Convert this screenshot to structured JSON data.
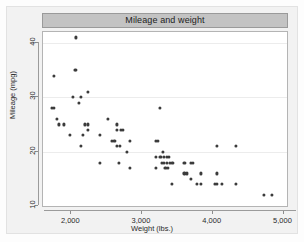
{
  "chart_data": {
    "type": "scatter",
    "title": "Mileage and weight",
    "xlabel": "Weight (lbs.)",
    "ylabel": "Mileage (mpg)",
    "xlim": [
      1600,
      5050
    ],
    "ylim": [
      10,
      42
    ],
    "xticks": [
      2000,
      3000,
      4000,
      5000
    ],
    "xticklabels": [
      "2,000",
      "3,000",
      "4,000",
      "5,000"
    ],
    "yticks": [
      10,
      20,
      30,
      40
    ],
    "yticklabels": [
      "10",
      "20",
      "30",
      "40"
    ],
    "grid": "horizontal",
    "legend": null,
    "marker_color": "#3b3b3b",
    "title_bar_color": "#c3c3c3",
    "graph_region_color": "#f2f2f2",
    "plot_region_color": "#ffffff",
    "points": [
      {
        "x": 2070,
        "y": 41
      },
      {
        "x": 1760,
        "y": 34
      },
      {
        "x": 2050,
        "y": 35
      },
      {
        "x": 2070,
        "y": 35
      },
      {
        "x": 2230,
        "y": 31
      },
      {
        "x": 2020,
        "y": 30
      },
      {
        "x": 2130,
        "y": 30
      },
      {
        "x": 2110,
        "y": 29
      },
      {
        "x": 3250,
        "y": 28
      },
      {
        "x": 1730,
        "y": 28
      },
      {
        "x": 1760,
        "y": 28
      },
      {
        "x": 1800,
        "y": 26
      },
      {
        "x": 2520,
        "y": 26
      },
      {
        "x": 1830,
        "y": 25
      },
      {
        "x": 1890,
        "y": 25
      },
      {
        "x": 2190,
        "y": 25
      },
      {
        "x": 2230,
        "y": 25
      },
      {
        "x": 2650,
        "y": 24
      },
      {
        "x": 2700,
        "y": 24
      },
      {
        "x": 2730,
        "y": 24
      },
      {
        "x": 2240,
        "y": 24
      },
      {
        "x": 2640,
        "y": 25
      },
      {
        "x": 1980,
        "y": 23
      },
      {
        "x": 2160,
        "y": 23
      },
      {
        "x": 2400,
        "y": 23
      },
      {
        "x": 2580,
        "y": 22
      },
      {
        "x": 2610,
        "y": 22
      },
      {
        "x": 2830,
        "y": 22
      },
      {
        "x": 3200,
        "y": 22
      },
      {
        "x": 3230,
        "y": 22
      },
      {
        "x": 2640,
        "y": 21
      },
      {
        "x": 2130,
        "y": 21
      },
      {
        "x": 4060,
        "y": 21
      },
      {
        "x": 4330,
        "y": 21
      },
      {
        "x": 2690,
        "y": 21
      },
      {
        "x": 2790,
        "y": 20
      },
      {
        "x": 3290,
        "y": 20
      },
      {
        "x": 3260,
        "y": 19
      },
      {
        "x": 3310,
        "y": 19
      },
      {
        "x": 3350,
        "y": 19
      },
      {
        "x": 3380,
        "y": 19
      },
      {
        "x": 3200,
        "y": 19
      },
      {
        "x": 2400,
        "y": 18
      },
      {
        "x": 2670,
        "y": 18
      },
      {
        "x": 3310,
        "y": 18
      },
      {
        "x": 3350,
        "y": 18
      },
      {
        "x": 3400,
        "y": 18
      },
      {
        "x": 3430,
        "y": 18
      },
      {
        "x": 3600,
        "y": 18
      },
      {
        "x": 3690,
        "y": 18
      },
      {
        "x": 3720,
        "y": 18
      },
      {
        "x": 3280,
        "y": 18
      },
      {
        "x": 2830,
        "y": 17
      },
      {
        "x": 3190,
        "y": 17
      },
      {
        "x": 3330,
        "y": 17
      },
      {
        "x": 3370,
        "y": 17
      },
      {
        "x": 3600,
        "y": 16
      },
      {
        "x": 3640,
        "y": 16
      },
      {
        "x": 3830,
        "y": 16
      },
      {
        "x": 4060,
        "y": 16
      },
      {
        "x": 3690,
        "y": 15
      },
      {
        "x": 3420,
        "y": 14
      },
      {
        "x": 3780,
        "y": 14
      },
      {
        "x": 3830,
        "y": 14
      },
      {
        "x": 4030,
        "y": 14
      },
      {
        "x": 4060,
        "y": 14
      },
      {
        "x": 4130,
        "y": 14
      },
      {
        "x": 4330,
        "y": 14
      },
      {
        "x": 4720,
        "y": 12
      },
      {
        "x": 4840,
        "y": 12
      }
    ]
  }
}
